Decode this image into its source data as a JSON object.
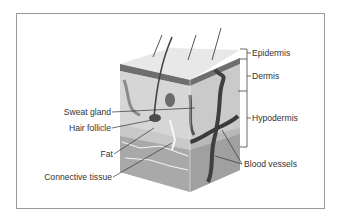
{
  "diagram": {
    "layers": [
      {
        "label": "Epidermis"
      },
      {
        "label": "Dermis"
      },
      {
        "label": "Hypodermis"
      }
    ],
    "left_labels": [
      {
        "label": "Sweat gland"
      },
      {
        "label": "Hair follicle"
      },
      {
        "label": "Fat"
      },
      {
        "label": "Connective tissue"
      }
    ],
    "right_labels": [
      {
        "label": "Blood vessels"
      }
    ],
    "colors": {
      "frame": "#9a9a9a",
      "skin_top": "#e6e6e6",
      "epidermis_band": "#6e6e6e",
      "dermis": "#cfcfcf",
      "hypodermis": "#bdbdbd",
      "vessel": "#4a4a4a",
      "text": "#333333"
    }
  }
}
